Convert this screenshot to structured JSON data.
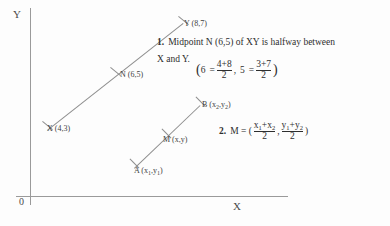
{
  "diagram": {
    "axes": {
      "y_label": "Y",
      "x_label": "X",
      "origin_label": "0"
    },
    "segment_xy": {
      "name": "XY",
      "endpoints": [
        {
          "key": "X",
          "label": "X (4,3)",
          "coords": [
            4,
            3
          ]
        },
        {
          "key": "Y",
          "label": "Y (8,7)",
          "coords": [
            8,
            7
          ]
        }
      ],
      "midpoint": {
        "key": "N",
        "label": "N (6,5)",
        "coords": [
          6,
          5
        ]
      }
    },
    "segment_ab": {
      "name": "AB",
      "endpoints": [
        {
          "key": "A",
          "label_prefix": "A (x",
          "sub1": "1",
          "label_mid": ",y",
          "sub2": "1",
          "label_suffix": ")"
        },
        {
          "key": "B",
          "label_prefix": "B (x",
          "sub1": "2",
          "label_mid": ",y",
          "sub2": "2",
          "label_suffix": ")"
        }
      ],
      "midpoint": {
        "key": "M",
        "label": "M (x,y)"
      }
    }
  },
  "statements": {
    "one": {
      "number": "1.",
      "line1": "Midpoint N (6,5) of XY is halfway between",
      "line2": "X and Y.",
      "equation": {
        "open_paren": "(",
        "left_value": "6",
        "equals": "=",
        "frac1_num": "4+8",
        "frac1_den": "2",
        "comma": ",",
        "right_value": "5",
        "equals2": "=",
        "frac2_num": "3+7",
        "frac2_den": "2",
        "close_paren": ")"
      }
    },
    "two": {
      "number": "2.",
      "lead": "M = (",
      "frac1_num_x1": "x",
      "frac1_sub1": "1",
      "frac1_plus": "+x",
      "frac1_sub2": "2",
      "frac1_den": "2",
      "comma": ",",
      "frac2_num_y1": "y",
      "frac2_sub1": "1",
      "frac2_plus": "+y",
      "frac2_sub2": "2",
      "frac2_den": "2",
      "close_paren": ")"
    }
  },
  "colors": {
    "ink": "#2e2e2e",
    "line": "#8d8d8d",
    "axis": "#9a9a9a",
    "page": "#fdfdfd"
  }
}
